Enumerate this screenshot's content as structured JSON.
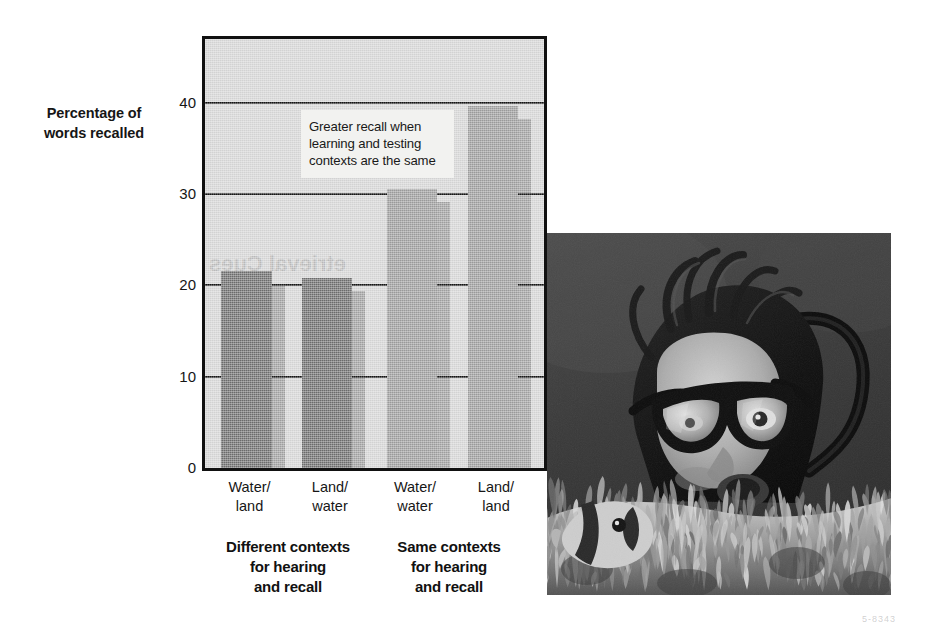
{
  "figure": {
    "y_axis_title_line1": "Percentage of",
    "y_axis_title_line2": "words recalled",
    "annotation_line1": "Greater recall when",
    "annotation_line2": "learning and testing",
    "annotation_line3": "contexts are the same",
    "bleed_text_plot": "etrieval Cues",
    "bleed_text_page": "5-8343"
  },
  "chart_data": {
    "type": "bar",
    "title": "",
    "xlabel": "",
    "ylabel": "Percentage of words recalled",
    "ylim": [
      0,
      47
    ],
    "yticks": [
      0,
      10,
      20,
      30,
      40
    ],
    "ytick_labels": [
      "0",
      "10",
      "20",
      "30",
      "40"
    ],
    "grid": true,
    "legend": false,
    "categories": [
      "Water/land",
      "Land/water",
      "Water/water",
      "Land/land"
    ],
    "category_lines": [
      [
        "Water/",
        "land"
      ],
      [
        "Land/",
        "water"
      ],
      [
        "Water/",
        "water"
      ],
      [
        "Land/",
        "land"
      ]
    ],
    "values": [
      21.6,
      20.8,
      30.6,
      39.7
    ],
    "bar_colors": [
      "#6b6b6b",
      "#6b6b6b",
      "#9a9a9a",
      "#9a9a9a"
    ],
    "groups": [
      {
        "label_lines": [
          "Different contexts",
          "for hearing",
          "and recall"
        ],
        "categories": [
          "Water/land",
          "Land/water"
        ]
      },
      {
        "label_lines": [
          "Same contexts",
          "for hearing",
          "and recall"
        ],
        "categories": [
          "Water/water",
          "Land/land"
        ]
      }
    ],
    "annotation": "Greater recall when learning and testing contexts are the same"
  },
  "photo": {
    "caption": "",
    "alt": "scuba-diver-with-mask-behind-sea-anemone-and-clownfish"
  }
}
